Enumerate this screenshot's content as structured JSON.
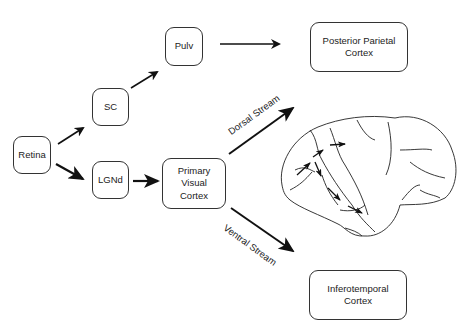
{
  "nodes": {
    "retina": "Retina",
    "sc": "SC",
    "pulv": "Pulv",
    "lgnd": "LGNd",
    "v1_line1": "Primary",
    "v1_line2": "Visual",
    "v1_line3": "Cortex",
    "ppc_line1": "Posterior Parietal",
    "ppc_line2": "Cortex",
    "it_line1": "Inferotemporal",
    "it_line2": "Cortex"
  },
  "streams": {
    "dorsal": "Dorsal Stream",
    "ventral": "Ventral Stream"
  },
  "edges": [
    {
      "from": "Retina",
      "to": "SC"
    },
    {
      "from": "Retina",
      "to": "LGNd"
    },
    {
      "from": "SC",
      "to": "Pulv"
    },
    {
      "from": "Pulv",
      "to": "Posterior Parietal Cortex"
    },
    {
      "from": "LGNd",
      "to": "Primary Visual Cortex"
    },
    {
      "from": "Primary Visual Cortex",
      "to": "Posterior Parietal Cortex",
      "label": "Dorsal Stream"
    },
    {
      "from": "Primary Visual Cortex",
      "to": "Inferotemporal Cortex",
      "label": "Ventral Stream"
    }
  ]
}
